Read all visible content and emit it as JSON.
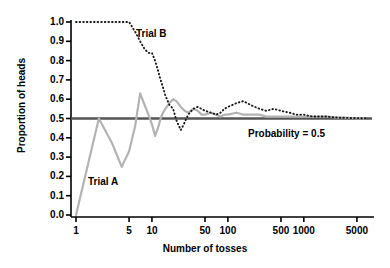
{
  "chart_data": {
    "type": "line",
    "title": "",
    "xlabel": "Number of tosses",
    "ylabel": "Proportion of heads",
    "xscale": "log",
    "xlim": [
      1,
      7000
    ],
    "ylim": [
      0.0,
      1.0
    ],
    "grid": false,
    "legend": "inline-annotations",
    "xtick_labels": [
      "1",
      "5",
      "10",
      "50",
      "100",
      "500",
      "1000",
      "5000"
    ],
    "xtick_values": [
      1,
      5,
      10,
      50,
      100,
      500,
      1000,
      5000
    ],
    "ytick_labels": [
      "0.0",
      "0.1",
      "0.2",
      "0.3",
      "0.4",
      "0.5",
      "0.6",
      "0.7",
      "0.8",
      "0.9",
      "1.0"
    ],
    "ytick_values": [
      0.0,
      0.1,
      0.2,
      0.3,
      0.4,
      0.5,
      0.6,
      0.7,
      0.8,
      0.9,
      1.0
    ],
    "reference_line": {
      "label": "Probability = 0.5",
      "value": 0.5,
      "color": "#555555"
    },
    "series": [
      {
        "name": "Trial A",
        "label": "Trial A",
        "style": "solid",
        "color": "#b3b3b3",
        "points": [
          [
            1,
            0.0
          ],
          [
            2,
            0.5
          ],
          [
            3,
            0.37
          ],
          [
            4,
            0.25
          ],
          [
            5,
            0.33
          ],
          [
            6,
            0.46
          ],
          [
            7,
            0.63
          ],
          [
            8,
            0.57
          ],
          [
            9,
            0.52
          ],
          [
            10,
            0.47
          ],
          [
            11,
            0.41
          ],
          [
            12,
            0.45
          ],
          [
            13,
            0.5
          ],
          [
            14,
            0.53
          ],
          [
            15,
            0.55
          ],
          [
            17,
            0.58
          ],
          [
            19,
            0.6
          ],
          [
            21,
            0.59
          ],
          [
            24,
            0.56
          ],
          [
            27,
            0.54
          ],
          [
            30,
            0.53
          ],
          [
            35,
            0.55
          ],
          [
            40,
            0.54
          ],
          [
            45,
            0.52
          ],
          [
            50,
            0.52
          ],
          [
            60,
            0.53
          ],
          [
            70,
            0.52
          ],
          [
            80,
            0.51
          ],
          [
            90,
            0.52
          ],
          [
            100,
            0.52
          ],
          [
            130,
            0.53
          ],
          [
            160,
            0.52
          ],
          [
            200,
            0.52
          ],
          [
            260,
            0.52
          ],
          [
            320,
            0.51
          ],
          [
            400,
            0.51
          ],
          [
            500,
            0.51
          ],
          [
            650,
            0.51
          ],
          [
            800,
            0.51
          ],
          [
            1000,
            0.51
          ],
          [
            1300,
            0.51
          ],
          [
            1600,
            0.51
          ],
          [
            2000,
            0.51
          ],
          [
            2600,
            0.505
          ],
          [
            3200,
            0.505
          ],
          [
            4000,
            0.503
          ],
          [
            5000,
            0.502
          ],
          [
            6500,
            0.501
          ]
        ]
      },
      {
        "name": "Trial B",
        "label": "Trial B",
        "style": "dotted",
        "color": "#1a1a1a",
        "points": [
          [
            1,
            1.0
          ],
          [
            2,
            1.0
          ],
          [
            3,
            1.0
          ],
          [
            4,
            1.0
          ],
          [
            5,
            1.0
          ],
          [
            6,
            0.95
          ],
          [
            7,
            0.9
          ],
          [
            8,
            0.86
          ],
          [
            9,
            0.84
          ],
          [
            10,
            0.84
          ],
          [
            11,
            0.8
          ],
          [
            12,
            0.75
          ],
          [
            13,
            0.7
          ],
          [
            14,
            0.66
          ],
          [
            15,
            0.62
          ],
          [
            17,
            0.57
          ],
          [
            19,
            0.55
          ],
          [
            21,
            0.49
          ],
          [
            24,
            0.44
          ],
          [
            27,
            0.48
          ],
          [
            30,
            0.52
          ],
          [
            35,
            0.55
          ],
          [
            40,
            0.56
          ],
          [
            45,
            0.55
          ],
          [
            50,
            0.54
          ],
          [
            60,
            0.53
          ],
          [
            70,
            0.52
          ],
          [
            80,
            0.53
          ],
          [
            90,
            0.55
          ],
          [
            100,
            0.56
          ],
          [
            130,
            0.58
          ],
          [
            160,
            0.59
          ],
          [
            200,
            0.57
          ],
          [
            260,
            0.55
          ],
          [
            320,
            0.54
          ],
          [
            400,
            0.55
          ],
          [
            500,
            0.54
          ],
          [
            650,
            0.53
          ],
          [
            800,
            0.52
          ],
          [
            1000,
            0.52
          ],
          [
            1300,
            0.51
          ],
          [
            1600,
            0.51
          ],
          [
            2000,
            0.51
          ],
          [
            2600,
            0.505
          ],
          [
            3200,
            0.504
          ],
          [
            4000,
            0.503
          ],
          [
            5000,
            0.502
          ],
          [
            6500,
            0.501
          ]
        ]
      }
    ]
  },
  "axes": {
    "ylabel": "Proportion of heads",
    "xlabel": "Number of tosses",
    "yticks": [
      "1.0",
      "0.9",
      "0.8",
      "0.7",
      "0.6",
      "0.5",
      "0.4",
      "0.3",
      "0.2",
      "0.1",
      "0.0"
    ],
    "xticks": [
      "1",
      "5",
      "10",
      "50",
      "100",
      "500",
      "1000",
      "5000"
    ]
  },
  "annotations": {
    "trial_a": "Trial A",
    "trial_b": "Trial B",
    "probability": "Probability = 0.5"
  },
  "colors": {
    "trial_a": "#b3b3b3",
    "trial_b": "#1a1a1a",
    "reference": "#555555",
    "axis": "#000000",
    "background": "#ffffff"
  }
}
